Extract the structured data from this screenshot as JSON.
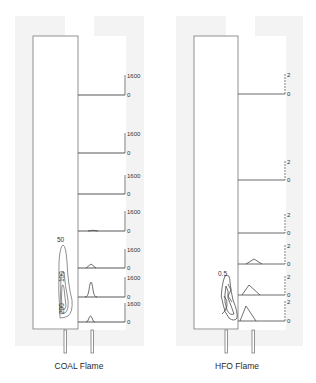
{
  "figure": {
    "panels": [
      {
        "id": "coal",
        "caption": "COAL Flame",
        "profiles": [
          {
            "top_label": "1600",
            "bottom_label": "0"
          },
          {
            "top_label": "1600",
            "bottom_label": "0"
          },
          {
            "top_label": "1600",
            "bottom_label": "0"
          },
          {
            "top_label": "1600",
            "bottom_label": "0"
          },
          {
            "top_label": "1600",
            "bottom_label": "0"
          },
          {
            "top_label": "1600",
            "bottom_label": "0"
          },
          {
            "top_label": "1600",
            "bottom_label": "0"
          }
        ],
        "contour_labels": [
          "50",
          "100",
          "200"
        ]
      },
      {
        "id": "hfo",
        "caption": "HFO Flame",
        "profiles": [
          {
            "top_label": "2",
            "bottom_label": "0"
          },
          {
            "top_label": "2",
            "bottom_label": "0"
          },
          {
            "top_label": "2",
            "bottom_label": "0"
          },
          {
            "top_label": "2",
            "bottom_label": "0"
          },
          {
            "top_label": "2",
            "bottom_label": "0"
          },
          {
            "top_label": "2",
            "bottom_label": "0"
          }
        ],
        "contour_labels": [
          "0.5"
        ]
      }
    ]
  }
}
